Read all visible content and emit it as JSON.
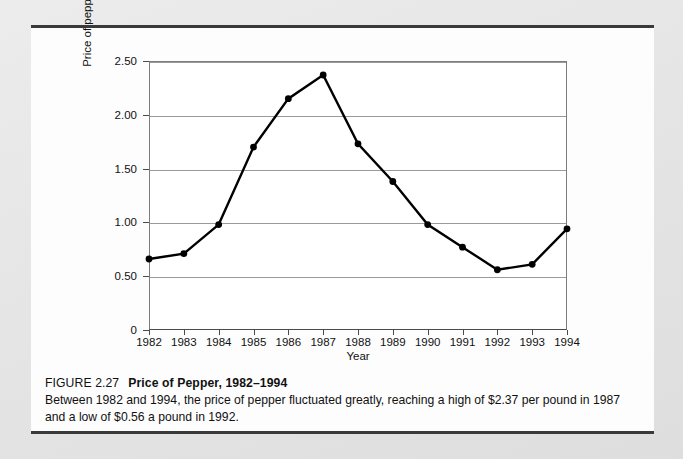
{
  "figure": {
    "number_label": "FIGURE 2.27",
    "title": "Price of Pepper, 1982–1994",
    "caption": "Between 1982 and 1994, the price of pepper fluctuated greatly, reaching a high of $2.37 per pound in 1987 and a low of $0.56 a pound in 1992."
  },
  "chart_data": {
    "type": "line",
    "title": "Price of Pepper, 1982–1994",
    "xlabel": "Year",
    "ylabel": "Price of pepper (dollars per pound)",
    "categories": [
      "1982",
      "1983",
      "1984",
      "1985",
      "1986",
      "1987",
      "1988",
      "1989",
      "1990",
      "1991",
      "1992",
      "1993",
      "1994"
    ],
    "x": [
      1982,
      1983,
      1984,
      1985,
      1986,
      1987,
      1988,
      1989,
      1990,
      1991,
      1992,
      1993,
      1994
    ],
    "values": [
      0.66,
      0.71,
      0.98,
      1.7,
      2.15,
      2.37,
      1.73,
      1.38,
      0.98,
      0.77,
      0.56,
      0.61,
      0.94
    ],
    "ylim": [
      0,
      2.5
    ],
    "xlim": [
      1982,
      1994
    ],
    "ytick_values": [
      0,
      0.5,
      1.0,
      1.5,
      2.0,
      2.5
    ],
    "ytick_labels": [
      "0",
      "0.50",
      "1.00",
      "1.50",
      "2.00",
      "2.50"
    ],
    "grid": true,
    "grid_axis": "y",
    "legend": false,
    "legend_position": "none",
    "marker": "circle",
    "line_color": "#000000",
    "marker_color": "#000000",
    "gridline_color": "#9a9a9a",
    "annotations": {
      "high": "$2.37 per pound in 1987",
      "low": "$0.56 a pound in 1992"
    }
  }
}
